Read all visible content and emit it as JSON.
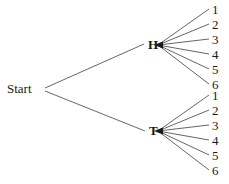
{
  "figure": {
    "name": "coin-toss-die-roll-tree-diagram",
    "type": "tree-diagram",
    "line_color": "#555555",
    "text_color": "#1a1a1a",
    "background_color": "#ffffff"
  },
  "root": {
    "label": "Start",
    "x": 42,
    "y": 89
  },
  "branches": [
    {
      "id": "heads",
      "label": "H",
      "label_x": 148,
      "label_y": 38,
      "node_x": 158,
      "node_y": 45,
      "leaves": [
        {
          "label": "1",
          "x": 212,
          "y": 3
        },
        {
          "label": "2",
          "x": 212,
          "y": 18
        },
        {
          "label": "3",
          "x": 212,
          "y": 33
        },
        {
          "label": "4",
          "x": 212,
          "y": 48
        },
        {
          "label": "5",
          "x": 212,
          "y": 63
        },
        {
          "label": "6",
          "x": 212,
          "y": 78
        }
      ]
    },
    {
      "id": "tails",
      "label": "T",
      "label_x": 149,
      "label_y": 124,
      "node_x": 158,
      "node_y": 131,
      "leaves": [
        {
          "label": "1",
          "x": 212,
          "y": 89
        },
        {
          "label": "2",
          "x": 212,
          "y": 104
        },
        {
          "label": "3",
          "x": 212,
          "y": 119
        },
        {
          "label": "4",
          "x": 212,
          "y": 134
        },
        {
          "label": "5",
          "x": 212,
          "y": 149
        },
        {
          "label": "6",
          "x": 212,
          "y": 164
        }
      ]
    }
  ],
  "edges": {
    "root_to_heads": {
      "x1": 45,
      "y1": 88,
      "x2": 144,
      "y2": 44
    },
    "root_to_tails": {
      "x1": 45,
      "y1": 91,
      "x2": 145,
      "y2": 131
    },
    "heads_fan_end_x": 209,
    "tails_fan_end_x": 209
  }
}
